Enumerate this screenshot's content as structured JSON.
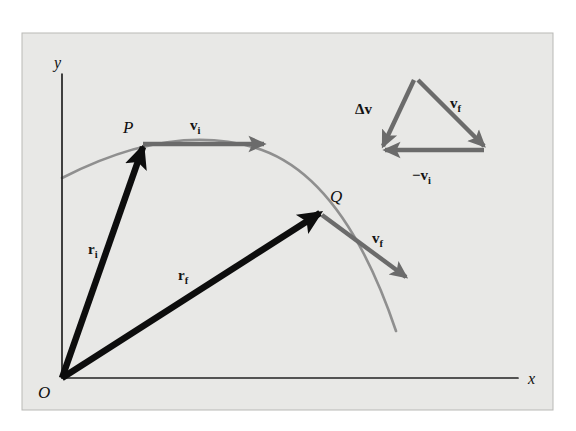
{
  "figure": {
    "name": "projectile-motion-vector-diagram",
    "panel": {
      "background_color": "#e8e8e6",
      "border_color": "#b9b9b6",
      "x": 22,
      "y": 33,
      "width": 531,
      "height": 377
    },
    "page_background": "#ffffff",
    "colors": {
      "position_vector": "#0d0d0d",
      "velocity_vector": "#6b6b6b",
      "trajectory": "#8f8f8f",
      "axis": "#222222",
      "text": "#121212"
    }
  },
  "axes": {
    "x_label": "x",
    "y_label": "y",
    "origin_label": "O",
    "x_axis": {
      "x1": 62,
      "y1": 378,
      "x2": 518,
      "y2": 378
    },
    "y_axis": {
      "x1": 62,
      "y1": 378,
      "x2": 62,
      "y2": 74
    },
    "x_label_pos": {
      "x": 528,
      "y": 384
    },
    "y_label_pos": {
      "x": 54,
      "y": 68
    },
    "origin_label_pos": {
      "x": 38,
      "y": 398
    }
  },
  "trajectory": {
    "name": "parabolic-path",
    "path": "M 62 178 Q 175 120 262 150 Q 345 180 396 331",
    "stroke_width": 2.6
  },
  "points": [
    {
      "id": "P",
      "label": "P",
      "x": 143,
      "y": 147,
      "label_x": 123,
      "label_y": 133
    },
    {
      "id": "Q",
      "label": "Q",
      "x": 320,
      "y": 213,
      "label_x": 330,
      "label_y": 202
    }
  ],
  "vectors": [
    {
      "id": "r_i",
      "label_main": "r",
      "label_sub": "i",
      "kind": "position",
      "color": "#0d0d0d",
      "x1": 62,
      "y1": 378,
      "x2": 143,
      "y2": 147,
      "width": 6.5,
      "label_x": 88,
      "label_y": 254
    },
    {
      "id": "r_f",
      "label_main": "r",
      "label_sub": "f",
      "kind": "position",
      "color": "#0d0d0d",
      "x1": 62,
      "y1": 378,
      "x2": 320,
      "y2": 213,
      "width": 6.5,
      "label_x": 178,
      "label_y": 280
    },
    {
      "id": "v_i",
      "label_main": "v",
      "label_sub": "i",
      "kind": "velocity",
      "color": "#6b6b6b",
      "x1": 143,
      "y1": 144,
      "x2": 264,
      "y2": 144,
      "width": 4.4,
      "label_x": 190,
      "label_y": 130
    },
    {
      "id": "v_f",
      "label_main": "v",
      "label_sub": "f",
      "kind": "velocity",
      "color": "#6b6b6b",
      "x1": 322,
      "y1": 215,
      "x2": 406,
      "y2": 277,
      "width": 4.4,
      "label_x": 372,
      "label_y": 243
    }
  ],
  "vector_triangle": {
    "name": "velocity-difference-triangle",
    "color": "#6b6b6b",
    "width": 4.4,
    "apex": {
      "x": 418,
      "y": 80
    },
    "right_vertex": {
      "x": 484,
      "y": 146
    },
    "left_vertex": {
      "x": 383,
      "y": 152
    },
    "edges": [
      {
        "id": "tri_v_f",
        "label_main": "v",
        "label_sub": "f",
        "x1": 418,
        "y1": 80,
        "x2": 484,
        "y2": 146,
        "label_x": 450,
        "label_y": 108
      },
      {
        "id": "tri_neg_v_i",
        "label_main": "−v",
        "label_sub": "i",
        "x1": 484,
        "y1": 150,
        "x2": 385,
        "y2": 150,
        "label_x": 412,
        "label_y": 180
      },
      {
        "id": "tri_delta_v",
        "label_main": "Δv",
        "label_sub": "",
        "x1": 414,
        "y1": 80,
        "x2": 383,
        "y2": 146,
        "label_x": 355,
        "label_y": 114
      }
    ]
  }
}
